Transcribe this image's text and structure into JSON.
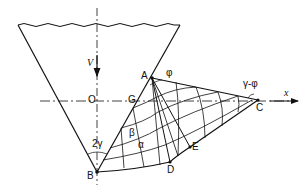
{
  "diagram": {
    "type": "slip-line field of funnel flow",
    "labels": {
      "v": "V",
      "O": "O",
      "G": "G",
      "A": "A",
      "phi": "φ",
      "gamma_minus_phi": "γ-φ",
      "C": "C",
      "x": "x",
      "two_gamma": "2γ",
      "beta": "β",
      "alpha": "α",
      "D": "D",
      "E": "E",
      "B": "B"
    },
    "colors": {
      "line": "#111111",
      "background": "#ffffff"
    }
  }
}
